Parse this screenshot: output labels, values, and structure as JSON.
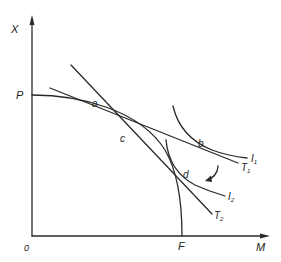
{
  "diagram": {
    "type": "economics-ppf-trade-diagram",
    "axes": {
      "y_label": "X",
      "x_label": "M",
      "origin_label": "0"
    },
    "intercepts": {
      "y_intercept_label": "P",
      "x_intercept_label": "F"
    },
    "points": {
      "a": "a",
      "b": "b",
      "c": "c",
      "d": "d"
    },
    "lines": {
      "T1": {
        "label": "T",
        "sub": "1"
      },
      "T2": {
        "label": "T",
        "sub": "2"
      }
    },
    "indifference_curves": {
      "I1": {
        "label": "I",
        "sub": "1"
      },
      "I2": {
        "label": "I",
        "sub": "2"
      }
    },
    "colors": {
      "stroke": "#2a2a2a",
      "background": "#ffffff"
    }
  }
}
